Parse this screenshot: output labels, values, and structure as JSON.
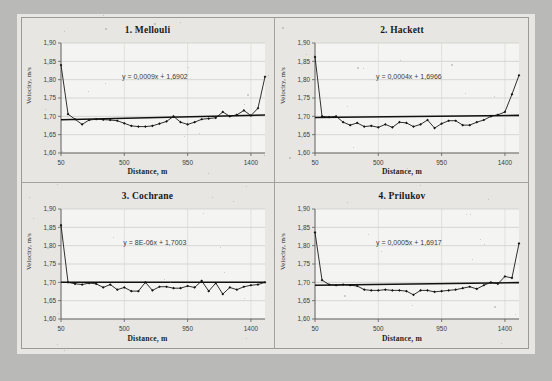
{
  "figure": {
    "background_color": "#b9b9b7",
    "paper_color": "#e7e6e3",
    "frame_color": "#9b9a97"
  },
  "chart_data": [
    {
      "type": "line",
      "title": "1. Mellouli",
      "xlabel": "Distance, m",
      "ylabel": "Velocity, m/s",
      "xlim": [
        50,
        1500
      ],
      "ylim": [
        1.6,
        1.9
      ],
      "xticks": [
        50,
        500,
        950,
        1400
      ],
      "xticklabels": [
        "50",
        "500",
        "950",
        "1400"
      ],
      "yticks": [
        1.6,
        1.65,
        1.7,
        1.75,
        1.8,
        1.85,
        1.9
      ],
      "yticklabels": [
        "1,60",
        "1,65",
        "1,70",
        "1,75",
        "1,80",
        "1,85",
        "1,90"
      ],
      "grid": true,
      "annotation": "y = 0,0009x + 1,6902",
      "trend": {
        "slope": 0.0009,
        "intercept": 1.6902,
        "units": "per 100 m"
      },
      "series": [
        {
          "name": "Velocity",
          "marker": "diamond",
          "x": [
            50,
            100,
            150,
            200,
            250,
            300,
            350,
            400,
            450,
            500,
            550,
            600,
            650,
            700,
            750,
            800,
            850,
            900,
            950,
            1000,
            1050,
            1100,
            1150,
            1200,
            1250,
            1300,
            1350,
            1400,
            1450,
            1500
          ],
          "values": [
            1.84,
            1.706,
            1.692,
            1.678,
            1.69,
            1.692,
            1.691,
            1.69,
            1.688,
            1.681,
            1.674,
            1.672,
            1.672,
            1.674,
            1.68,
            1.686,
            1.7,
            1.684,
            1.678,
            1.684,
            1.692,
            1.694,
            1.696,
            1.712,
            1.7,
            1.704,
            1.716,
            1.702,
            1.722,
            1.808
          ]
        }
      ]
    },
    {
      "type": "line",
      "title": "2. Hackett",
      "xlabel": "Distance, m",
      "ylabel": "Velocity, m/s",
      "xlim": [
        50,
        1500
      ],
      "ylim": [
        1.6,
        1.9
      ],
      "xticks": [
        50,
        500,
        950,
        1400
      ],
      "xticklabels": [
        "50",
        "500",
        "950",
        "1400"
      ],
      "yticks": [
        1.6,
        1.65,
        1.7,
        1.75,
        1.8,
        1.85,
        1.9
      ],
      "yticklabels": [
        "1,60",
        "1,65",
        "1,70",
        "1,75",
        "1,80",
        "1,85",
        "1,90"
      ],
      "grid": true,
      "annotation": "y = 0,0004x + 1,6966",
      "trend": {
        "slope": 0.0004,
        "intercept": 1.6966,
        "units": "per 100 m"
      },
      "series": [
        {
          "name": "Velocity",
          "marker": "diamond",
          "x": [
            50,
            100,
            150,
            200,
            250,
            300,
            350,
            400,
            450,
            500,
            550,
            600,
            650,
            700,
            750,
            800,
            850,
            900,
            950,
            1000,
            1050,
            1100,
            1150,
            1200,
            1250,
            1300,
            1350,
            1400,
            1450,
            1500
          ],
          "values": [
            1.862,
            1.7,
            1.698,
            1.7,
            1.684,
            1.676,
            1.682,
            1.672,
            1.674,
            1.67,
            1.678,
            1.67,
            1.684,
            1.682,
            1.672,
            1.678,
            1.69,
            1.668,
            1.68,
            1.688,
            1.688,
            1.676,
            1.676,
            1.684,
            1.69,
            1.7,
            1.704,
            1.712,
            1.76,
            1.812
          ]
        }
      ]
    },
    {
      "type": "line",
      "title": "3. Cochrane",
      "xlabel": "Distance, m",
      "ylabel": "Velocity, m/s",
      "xlim": [
        50,
        1500
      ],
      "ylim": [
        1.6,
        1.9
      ],
      "xticks": [
        50,
        500,
        950,
        1400
      ],
      "xticklabels": [
        "50",
        "500",
        "950",
        "1400"
      ],
      "yticks": [
        1.6,
        1.65,
        1.7,
        1.75,
        1.8,
        1.85,
        1.9
      ],
      "yticklabels": [
        "1,60",
        "1,65",
        "1,70",
        "1,75",
        "1,80",
        "1,85",
        "1,90"
      ],
      "grid": true,
      "annotation": "y = 8E-06x + 1,7003",
      "trend": {
        "slope": 8e-06,
        "intercept": 1.7003,
        "units": "per 100 m"
      },
      "series": [
        {
          "name": "Velocity",
          "marker": "diamond",
          "x": [
            50,
            100,
            150,
            200,
            250,
            300,
            350,
            400,
            450,
            500,
            550,
            600,
            650,
            700,
            750,
            800,
            850,
            900,
            950,
            1000,
            1050,
            1100,
            1150,
            1200,
            1250,
            1300,
            1350,
            1400,
            1450,
            1500
          ],
          "values": [
            1.856,
            1.7,
            1.696,
            1.694,
            1.698,
            1.696,
            1.686,
            1.694,
            1.68,
            1.686,
            1.676,
            1.676,
            1.7,
            1.678,
            1.688,
            1.688,
            1.684,
            1.684,
            1.69,
            1.686,
            1.704,
            1.676,
            1.698,
            1.668,
            1.686,
            1.68,
            1.688,
            1.692,
            1.694,
            1.7
          ]
        }
      ]
    },
    {
      "type": "line",
      "title": "4. Prilukov",
      "xlabel": "Distance, m",
      "ylabel": "Velocity, m/s",
      "xlim": [
        50,
        1500
      ],
      "ylim": [
        1.6,
        1.9
      ],
      "xticks": [
        50,
        500,
        950,
        1400
      ],
      "xticklabels": [
        "50",
        "500",
        "950",
        "1400"
      ],
      "yticks": [
        1.6,
        1.65,
        1.7,
        1.75,
        1.8,
        1.85,
        1.9
      ],
      "yticklabels": [
        "1,60",
        "1,65",
        "1,70",
        "1,75",
        "1,80",
        "1,85",
        "1,90"
      ],
      "grid": true,
      "annotation": "y = 0,0005x + 1,6917",
      "trend": {
        "slope": 0.0005,
        "intercept": 1.6917,
        "units": "per 100 m"
      },
      "series": [
        {
          "name": "Velocity",
          "marker": "diamond",
          "x": [
            50,
            100,
            150,
            200,
            250,
            300,
            350,
            400,
            450,
            500,
            550,
            600,
            650,
            700,
            750,
            800,
            850,
            900,
            950,
            1000,
            1050,
            1100,
            1150,
            1200,
            1250,
            1300,
            1350,
            1400,
            1450,
            1500
          ],
          "values": [
            1.836,
            1.706,
            1.694,
            1.692,
            1.694,
            1.692,
            1.69,
            1.68,
            1.678,
            1.678,
            1.68,
            1.678,
            1.678,
            1.676,
            1.666,
            1.678,
            1.678,
            1.674,
            1.676,
            1.678,
            1.68,
            1.684,
            1.688,
            1.682,
            1.692,
            1.7,
            1.696,
            1.716,
            1.712,
            1.806
          ]
        }
      ]
    }
  ]
}
